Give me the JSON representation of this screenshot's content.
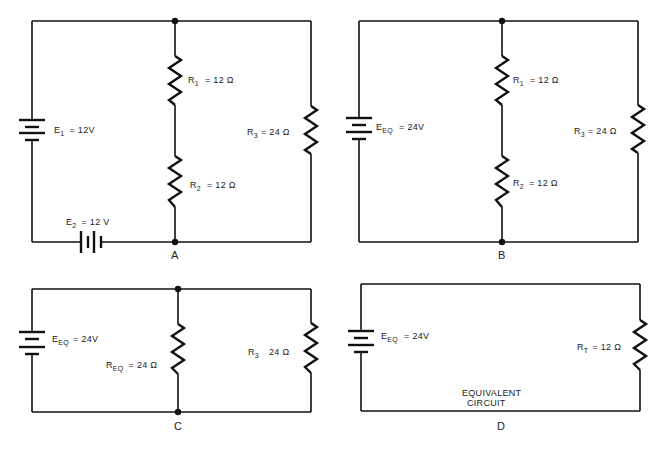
{
  "panels": {
    "a": {
      "label": "A",
      "e1": {
        "name": "E",
        "sub": "1",
        "value": "= 12V"
      },
      "e2": {
        "name": "E",
        "sub": "2",
        "value": "= 12 V"
      },
      "r1": {
        "name": "R",
        "sub": "1",
        "value": "= 12 Ω"
      },
      "r2": {
        "name": "R",
        "sub": "2",
        "value": "= 12 Ω"
      },
      "r3": {
        "name": "R",
        "sub": "3",
        "value": "= 24 Ω"
      }
    },
    "b": {
      "label": "B",
      "eeq": {
        "name": "E",
        "sub": "EQ",
        "value": "= 24V"
      },
      "r1": {
        "name": "R",
        "sub": "1",
        "value": "= 12 Ω"
      },
      "r2": {
        "name": "R",
        "sub": "2",
        "value": "= 12 Ω"
      },
      "r3": {
        "name": "R",
        "sub": "3",
        "value": "= 24 Ω"
      }
    },
    "c": {
      "label": "C",
      "eeq": {
        "name": "E",
        "sub": "EQ",
        "value": "= 24V"
      },
      "req": {
        "name": "R",
        "sub": "EQ",
        "value": "= 24 Ω"
      },
      "r3": {
        "name": "R",
        "sub": "3",
        "value": "24 Ω"
      }
    },
    "d": {
      "label": "D",
      "eeq": {
        "name": "E",
        "sub": "EQ",
        "value": "= 24V"
      },
      "rt": {
        "name": "R",
        "sub": "T",
        "value": "= 12 Ω"
      },
      "caption_line1": "EQUIVALENT",
      "caption_line2": "CIRCUIT"
    }
  }
}
